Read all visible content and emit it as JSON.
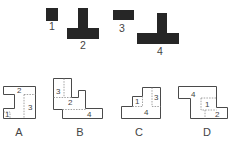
{
  "pieces": [
    {
      "id": "1",
      "label": "1",
      "shape": "small-square"
    },
    {
      "id": "2",
      "label": "2",
      "shape": "inverted-T"
    },
    {
      "id": "3",
      "label": "3",
      "shape": "horizontal-rectangle"
    },
    {
      "id": "4",
      "label": "4",
      "shape": "large-inverted-T"
    }
  ],
  "options": [
    {
      "id": "A",
      "label": "A",
      "piece_labels": [
        "1",
        "2",
        "3"
      ]
    },
    {
      "id": "B",
      "label": "B",
      "piece_labels": [
        "3",
        "2",
        "4"
      ]
    },
    {
      "id": "C",
      "label": "C",
      "piece_labels": [
        "1",
        "4",
        "3"
      ]
    },
    {
      "id": "D",
      "label": "D",
      "piece_labels": [
        "4",
        "1",
        "2"
      ]
    }
  ],
  "colors": {
    "piece_fill": "#262626",
    "outline": "#4a4a4a",
    "dashed": "#8a8a8a",
    "text": "#444444"
  }
}
